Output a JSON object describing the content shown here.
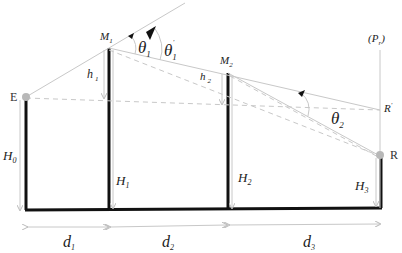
{
  "diagram": {
    "type": "multiple knife-edge diffraction geometry",
    "points": {
      "E": {
        "label": "E"
      },
      "R": {
        "label": "R"
      },
      "R_prime": {
        "label": "R",
        "sup": "'"
      },
      "M1": {
        "label": "M",
        "sub": "1"
      },
      "M2": {
        "label": "M",
        "sub": "2"
      },
      "Pr": {
        "label": "(P",
        "sub": "r",
        "tail": ")"
      }
    },
    "heights": {
      "H0": {
        "label": "H",
        "sub": "0"
      },
      "H1": {
        "label": "H",
        "sub": "1"
      },
      "H2": {
        "label": "H",
        "sub": "2"
      },
      "H3": {
        "label": "H",
        "sub": "3"
      },
      "h1": {
        "label": "h",
        "sub": "1"
      },
      "h2": {
        "label": "h",
        "sub": "2"
      }
    },
    "angles": {
      "theta1": {
        "label": "θ",
        "sub": "1"
      },
      "theta1_prime": {
        "label": "θ",
        "sub": "1",
        "sup": "'"
      },
      "theta2": {
        "label": "θ",
        "sub": "2"
      }
    },
    "distances": {
      "d1": {
        "label": "d",
        "sub": "1"
      },
      "d2": {
        "label": "d",
        "sub": "2"
      },
      "d3": {
        "label": "d",
        "sub": "3"
      }
    },
    "colors": {
      "structure": "#111111",
      "ray": "#c8c8c8",
      "dashed": "#c8c8c8",
      "node": "#b8b8b8",
      "arrow": "#111111"
    }
  }
}
